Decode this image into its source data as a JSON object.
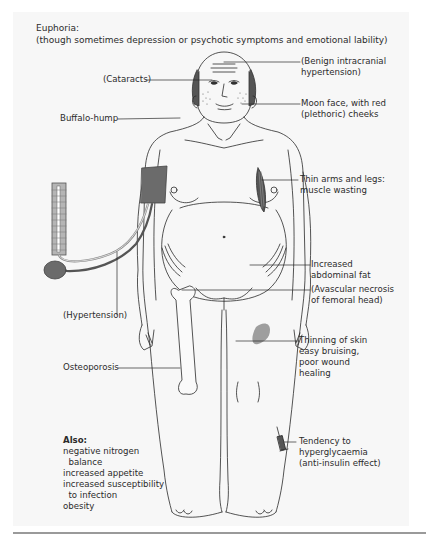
{
  "header": {
    "title": "Euphoria:",
    "subtitle": "(though sometimes depression or psychotic symptoms and emotional lability)"
  },
  "labels": {
    "benign_ih": "(Benign intracranial\nhypertension)",
    "cataracts": "(Cataracts)",
    "moon_face": "Moon face, with red\n(plethoric) cheeks",
    "buffalo_hump": "Buffalo-hump",
    "thin_arms": "Thin arms and legs:\nmuscle wasting",
    "abdominal_fat": "Increased\nabdominal fat",
    "avascular_necrosis": "(Avascular necrosis\nof femoral head)",
    "hypertension": "(Hypertension)",
    "thinning_skin": "Thinning of skin\neasy bruising,\npoor wound\nhealing",
    "osteoporosis": "Osteoporosis",
    "hyperglycaemia": "Tendency to\nhyperglycaemia\n(anti-insulin effect)"
  },
  "also": {
    "title": "Also:",
    "items": "negative nitrogen\n  balance\nincreased appetite\nincreased susceptibility\n  to infection\nobesity"
  },
  "colors": {
    "panel_bg": "#f7f7f7",
    "line": "#2a2a2a",
    "cuff": "#6b6b6b",
    "bruise": "#9e9e9e",
    "manometer": "#b5b5b5"
  }
}
